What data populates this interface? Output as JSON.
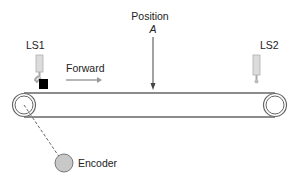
{
  "labels": {
    "ls1": "LS1",
    "ls2": "LS2",
    "forward": "Forward",
    "position": "Position",
    "position_letter": "A",
    "encoder": "Encoder"
  },
  "colors": {
    "line": "#555555",
    "sensor_fill": "#d8d8d8",
    "sensor_stroke": "#aaaaaa",
    "block": "#000000",
    "encoder_fill": "#c8c8c8",
    "arrow_gray": "#999999"
  }
}
